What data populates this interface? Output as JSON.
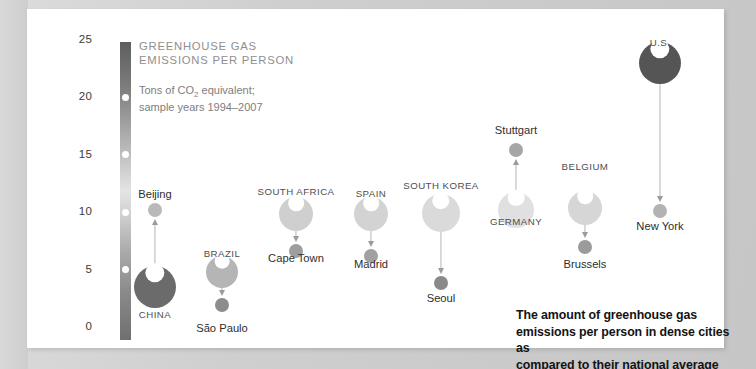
{
  "chart_data": {
    "type": "scatter",
    "title": "GREENHOUSE GAS\nEMISSIONS PER PERSON",
    "subtitle_line1": "Tons of CO",
    "subtitle_sub": "2",
    "subtitle_line2": " equivalent;",
    "subtitle_line3": "sample years 1994–2007",
    "subtitle": "Tons of CO2 equivalent;\nsample years 1994–2007",
    "caption": "The amount of greenhouse gas\nemissions per person in dense cities as\ncompared to their national average",
    "ylabel": "Tons of CO2 equivalent per person",
    "ylim": [
      0,
      25
    ],
    "yticks": [
      0,
      5,
      10,
      15,
      20,
      25
    ],
    "ytick_labels": [
      "0",
      "5",
      "10",
      "15",
      "20",
      "25"
    ],
    "grid": false,
    "legend": "none",
    "axis_style": "gradient-bar",
    "series": [
      {
        "name": "China / Beijing",
        "country": "CHINA",
        "city": "Beijing",
        "country_value": 3.5,
        "city_value": 10.2,
        "direction": "up",
        "country_color": "#6b6b6b",
        "city_color": "#b9b9b9"
      },
      {
        "name": "Brazil / São Paulo",
        "country": "BRAZIL",
        "city": "São Paulo",
        "country_value": 4.8,
        "city_value": 1.9,
        "direction": "down",
        "country_color": "#b5b5b5",
        "city_color": "#8c8c8c"
      },
      {
        "name": "South Africa / Cape Town",
        "country": "SOUTH AFRICA",
        "city": "Cape Town",
        "country_value": 9.8,
        "city_value": 6.6,
        "direction": "down",
        "country_color": "#cfcfcf",
        "city_color": "#9e9e9e"
      },
      {
        "name": "Spain / Madrid",
        "country": "SPAIN",
        "city": "Madrid",
        "country_value": 9.8,
        "city_value": 6.2,
        "direction": "down",
        "country_color": "#d3d3d3",
        "city_color": "#a1a1a1"
      },
      {
        "name": "South Korea / Seoul",
        "country": "SOUTH KOREA",
        "city": "Seoul",
        "country_value": 9.9,
        "city_value": 3.8,
        "direction": "down",
        "country_color": "#dadada",
        "city_color": "#8a8a8a"
      },
      {
        "name": "Germany / Stuttgart",
        "country": "GERMANY",
        "city": "Stuttgart",
        "country_value": 10.2,
        "city_value": 15.4,
        "direction": "up",
        "country_color": "#e0e0e0",
        "city_color": "#a6a6a6"
      },
      {
        "name": "Belgium / Brussels",
        "country": "BELGIUM",
        "city": "Brussels",
        "country_value": 10.4,
        "city_value": 7.0,
        "direction": "down",
        "country_color": "#d6d6d6",
        "city_color": "#9b9b9b"
      },
      {
        "name": "U.S. / New York",
        "country": "U.S.",
        "city": "New York",
        "country_value": 23.0,
        "city_value": 10.1,
        "direction": "down",
        "country_color": "#555555",
        "city_color": "#b3b3b3"
      }
    ]
  },
  "layout": {
    "clusters": [
      {
        "x": 155,
        "country_r": 21,
        "city_r": 7,
        "country_label_y": 309,
        "city_label_y": 188
      },
      {
        "x": 222,
        "country_r": 16,
        "city_r": 7,
        "country_label_y": 248,
        "city_label_y": 322
      },
      {
        "x": 296,
        "country_r": 17,
        "city_r": 7,
        "country_label_y": 186,
        "city_label_y": 252
      },
      {
        "x": 371,
        "country_r": 17,
        "city_r": 7,
        "country_label_y": 188,
        "city_label_y": 258
      },
      {
        "x": 441,
        "country_r": 19,
        "city_r": 7,
        "country_label_y": 180,
        "city_label_y": 292
      },
      {
        "x": 516,
        "country_r": 18,
        "city_r": 7,
        "country_label_y": 216,
        "city_label_y": 124
      },
      {
        "x": 585,
        "country_r": 17,
        "city_r": 7,
        "country_label_y": 161,
        "city_label_y": 258
      },
      {
        "x": 660,
        "country_r": 21,
        "city_r": 7,
        "country_label_y": 37,
        "city_label_y": 220
      }
    ],
    "axis": {
      "top_y": 40,
      "bottom_y": 327,
      "value_top": 25,
      "value_bottom": 0
    }
  }
}
